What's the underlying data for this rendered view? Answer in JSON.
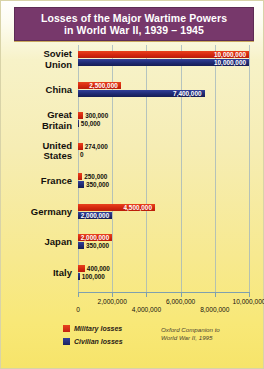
{
  "title": {
    "line1": "Losses of the Major Wartime Powers",
    "line2": "in World War II, 1939 – 1945"
  },
  "legend": {
    "military_label": "Military losses",
    "civilian_label": "Civilian losses",
    "military_color": "#d4260f",
    "civilian_color": "#1f2a72"
  },
  "source": {
    "line1": "Oxford Companion to",
    "line2": "World War II, 1995"
  },
  "axis": {
    "ticks": [
      "0",
      "2,000,000",
      "4,000,000",
      "6,000,000",
      "8,000,000",
      "10,000,000"
    ]
  },
  "rows": [
    {
      "label_line1": "Soviet",
      "label_line2": "Union",
      "military_text": "10,000,000",
      "civilian_text": "10,000,000"
    },
    {
      "label_line1": "China",
      "label_line2": "",
      "military_text": "2,500,000",
      "civilian_text": "7,400,000"
    },
    {
      "label_line1": "Great",
      "label_line2": "Britain",
      "military_text": "300,000",
      "civilian_text": "50,000"
    },
    {
      "label_line1": "United",
      "label_line2": "States",
      "military_text": "274,000",
      "civilian_text": "0"
    },
    {
      "label_line1": "France",
      "label_line2": "",
      "military_text": "250,000",
      "civilian_text": "350,000"
    },
    {
      "label_line1": "Germany",
      "label_line2": "",
      "military_text": "4,500,000",
      "civilian_text": "2,000,000"
    },
    {
      "label_line1": "Japan",
      "label_line2": "",
      "military_text": "2,000,000",
      "civilian_text": "350,000"
    },
    {
      "label_line1": "Italy",
      "label_line2": "",
      "military_text": "400,000",
      "civilian_text": "100,000"
    }
  ],
  "chart_data": {
    "type": "bar",
    "orientation": "horizontal",
    "title": "Losses of the Major Wartime Powers in World War II, 1939 – 1945",
    "xlabel": "",
    "ylabel": "",
    "xlim": [
      0,
      10000000
    ],
    "xticks": [
      0,
      2000000,
      4000000,
      6000000,
      8000000,
      10000000
    ],
    "grid": true,
    "legend_position": "bottom-left",
    "categories": [
      "Soviet Union",
      "China",
      "Great Britain",
      "United States",
      "France",
      "Germany",
      "Japan",
      "Italy"
    ],
    "series": [
      {
        "name": "Military losses",
        "color": "#d4260f",
        "values": [
          10000000,
          2500000,
          300000,
          274000,
          250000,
          4500000,
          2000000,
          400000
        ]
      },
      {
        "name": "Civilian losses",
        "color": "#1f2a72",
        "values": [
          10000000,
          7400000,
          50000,
          0,
          350000,
          2000000,
          350000,
          100000
        ]
      }
    ],
    "source": "Oxford Companion to World War II, 1995"
  }
}
